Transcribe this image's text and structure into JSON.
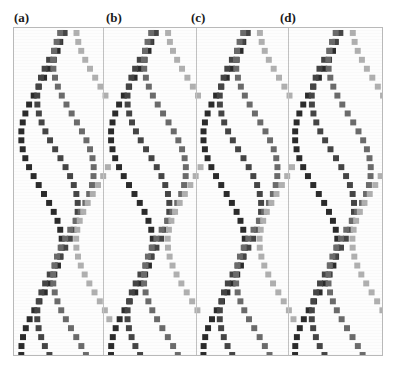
{
  "figure": {
    "background": "#ffffff",
    "plot_area": {
      "x": 13,
      "y": 27,
      "width": 370,
      "height": 329,
      "border_color": "#b9b9b9",
      "fill": "#fdfdfd"
    },
    "panel_dividers_x": [
      103,
      196,
      288
    ]
  },
  "panels": [
    {
      "id": "a",
      "label": "(a)",
      "label_x": 22,
      "label_y": 11
    },
    {
      "id": "b",
      "label": "(b)",
      "label_x": 114,
      "label_y": 11
    },
    {
      "id": "c",
      "label": "(c)",
      "label_x": 199,
      "label_y": 11
    },
    {
      "id": "d",
      "label": "(d)",
      "label_x": 288,
      "label_y": 11
    }
  ],
  "marker": {
    "shape": "square",
    "size_px": 6,
    "spacing_px": 9
  },
  "colors": {
    "darkest": "#2b2b2b",
    "dark": "#3d3d3d",
    "mid_dark": "#555555",
    "mid": "#6e6e6e",
    "mid_light": "#8f8f8f",
    "light": "#ababab",
    "lightest": "#c6c6c6",
    "border": "#b9b9b9",
    "label": "#1a1a1a"
  },
  "chart_data": {
    "type": "line",
    "title": "",
    "subtitle": "",
    "xlabel": "",
    "ylabel": "",
    "grid": false,
    "legend": "none",
    "orientation": "vertical-independent-axis",
    "note": "Four side-by-side panels (a)-(d). Each panel plots several oscillating (sinusoidal) curves rendered as dotted/square-marker traces. The independent variable runs down the vertical axis; the oscillation is in the horizontal direction. Curves in each panel share the same period but are phase shifted and shaded from dark grey to light grey.",
    "xlim": [
      0,
      1
    ],
    "ylim": [
      0,
      1
    ],
    "panels": [
      {
        "id": "a",
        "label": "(a)",
        "x_range_px": [
          14,
          103
        ],
        "series": [
          {
            "name": "trace-1",
            "color": "#2b2b2b",
            "amplitude": 0.46,
            "period": 0.66,
            "phase": 0.0,
            "center": 0.3
          },
          {
            "name": "trace-2",
            "color": "#454545",
            "amplitude": 0.46,
            "period": 0.66,
            "phase": 0.17,
            "center": 0.48
          },
          {
            "name": "trace-3",
            "color": "#6b6b6b",
            "amplitude": 0.46,
            "period": 0.66,
            "phase": 0.34,
            "center": 0.66
          },
          {
            "name": "trace-4",
            "color": "#b0b0b0",
            "amplitude": 0.46,
            "period": 0.66,
            "phase": 0.51,
            "center": 0.92
          }
        ]
      },
      {
        "id": "b",
        "label": "(b)",
        "x_range_px": [
          104,
          196
        ],
        "series": [
          {
            "name": "trace-1",
            "color": "#2b2b2b",
            "amplitude": 0.46,
            "period": 0.66,
            "phase": 0.0,
            "center": 0.3
          },
          {
            "name": "trace-2",
            "color": "#454545",
            "amplitude": 0.46,
            "period": 0.66,
            "phase": 0.17,
            "center": 0.48
          },
          {
            "name": "trace-3",
            "color": "#6b6b6b",
            "amplitude": 0.46,
            "period": 0.66,
            "phase": 0.34,
            "center": 0.66
          },
          {
            "name": "trace-4",
            "color": "#b0b0b0",
            "amplitude": 0.46,
            "period": 0.66,
            "phase": 0.51,
            "center": 0.92
          }
        ]
      },
      {
        "id": "c",
        "label": "(c)",
        "x_range_px": [
          197,
          288
        ],
        "series": [
          {
            "name": "trace-1",
            "color": "#2b2b2b",
            "amplitude": 0.46,
            "period": 0.66,
            "phase": 0.0,
            "center": 0.3
          },
          {
            "name": "trace-2",
            "color": "#454545",
            "amplitude": 0.46,
            "period": 0.66,
            "phase": 0.17,
            "center": 0.48
          },
          {
            "name": "trace-3",
            "color": "#6b6b6b",
            "amplitude": 0.46,
            "period": 0.66,
            "phase": 0.34,
            "center": 0.66
          },
          {
            "name": "trace-4",
            "color": "#b0b0b0",
            "amplitude": 0.46,
            "period": 0.66,
            "phase": 0.51,
            "center": 0.92
          }
        ]
      },
      {
        "id": "d",
        "label": "(d)",
        "x_range_px": [
          289,
          382
        ],
        "series": [
          {
            "name": "trace-1",
            "color": "#2b2b2b",
            "amplitude": 0.46,
            "period": 0.66,
            "phase": 0.0,
            "center": 0.3
          },
          {
            "name": "trace-2",
            "color": "#454545",
            "amplitude": 0.46,
            "period": 0.66,
            "phase": 0.17,
            "center": 0.48
          },
          {
            "name": "trace-3",
            "color": "#6b6b6b",
            "amplitude": 0.46,
            "period": 0.66,
            "phase": 0.34,
            "center": 0.66
          },
          {
            "name": "trace-4",
            "color": "#b0b0b0",
            "amplitude": 0.46,
            "period": 0.66,
            "phase": 0.51,
            "center": 0.92
          }
        ]
      }
    ]
  }
}
